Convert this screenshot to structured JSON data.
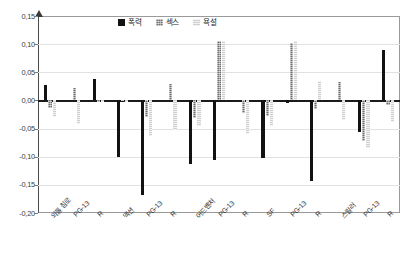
{
  "chart_data": {
    "type": "bar",
    "title": "",
    "subtitle": "",
    "xlabel": "",
    "ylabel": "",
    "ylim": [
      -0.2,
      0.15
    ],
    "yticks": [
      "0,15",
      "0,10",
      "0,05",
      "0,00",
      "-0,05",
      "-0,10",
      "-0,15",
      "-0,20"
    ],
    "ytick_values": [
      0.15,
      0.1,
      0.05,
      0.0,
      -0.05,
      -0.1,
      -0.15,
      -0.2
    ],
    "grid": true,
    "legend_position": "top-center",
    "groups": [
      "외톨 침로",
      "액션",
      "어드벤처",
      "SF",
      "스릴러"
    ],
    "categories": [
      "외톨 침로",
      "PG-13",
      "R",
      "액션",
      "PG-13",
      "R",
      "어드벤처",
      "PG-13",
      "R",
      "SF",
      "PG-13",
      "R",
      "스릴러",
      "PG-13",
      "R"
    ],
    "series": [
      {
        "name": "폭력",
        "color": "#121212",
        "values": [
          0.028,
          0.0,
          0.038,
          -0.1,
          -0.168,
          0.0,
          -0.113,
          -0.106,
          0.0,
          -0.103,
          -0.004,
          -0.143,
          0.0,
          -0.056,
          0.09
        ]
      },
      {
        "name": "섹스",
        "color": "#6d6d6d",
        "values": [
          -0.013,
          0.022,
          -0.003,
          -0.001,
          -0.03,
          0.03,
          -0.032,
          0.105,
          -0.023,
          -0.028,
          0.102,
          -0.015,
          0.032,
          -0.072,
          -0.008
        ]
      },
      {
        "name": "욕설",
        "color": "#cfcfcf",
        "values": [
          -0.03,
          -0.042,
          -0.002,
          -0.002,
          -0.064,
          -0.052,
          -0.045,
          0.105,
          -0.06,
          -0.046,
          0.105,
          0.035,
          -0.034,
          -0.085,
          -0.038
        ]
      }
    ]
  },
  "legend": {
    "items": [
      {
        "label": "폭력",
        "color": "#121212"
      },
      {
        "label": "섹스",
        "color": "#6d6d6d"
      },
      {
        "label": "욕설",
        "color": "#cfcfcf"
      }
    ]
  }
}
